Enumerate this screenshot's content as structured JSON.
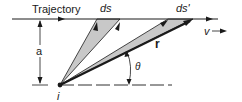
{
  "diagram": {
    "labels": {
      "trajectory": "Trajectory",
      "ds": "ds",
      "ds_prime": "ds'",
      "velocity": "v",
      "distance": "a",
      "radius": "r",
      "angle": "θ",
      "observer": "i"
    },
    "colors": {
      "line": "#1a1a1a",
      "wedge_fill": "#c8c8c8",
      "background": "#ffffff"
    }
  }
}
